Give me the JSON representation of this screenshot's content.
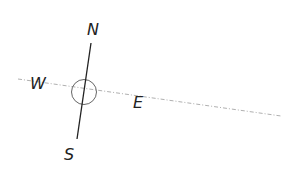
{
  "diagram": {
    "type": "compass",
    "labels": {
      "north": "N",
      "south": "S",
      "east": "E",
      "west": "W"
    },
    "colors": {
      "needle": "#222222",
      "circle": "#555555",
      "dashed_axis": "#aaaaaa",
      "label": "#222222"
    }
  }
}
